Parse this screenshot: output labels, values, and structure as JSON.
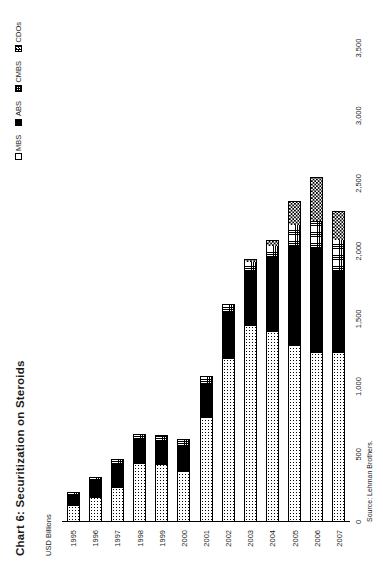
{
  "chart_data": {
    "type": "bar",
    "orientation": "horizontal-stacked",
    "title": "Chart 6: Securitization on Steroids",
    "ylabel": "USD Billions",
    "xlabel": "",
    "source": "Source: Lehman Brothers.",
    "grid": false,
    "legend_position": "top-right",
    "value_axis_range": [
      0,
      3500
    ],
    "value_axis_ticks": [
      "0",
      "500",
      "1,000",
      "1,500",
      "2,000",
      "2,500",
      "3,000",
      "3,500"
    ],
    "value_axis_tick_values": [
      0,
      500,
      1000,
      1500,
      2000,
      2500,
      3000,
      3500
    ],
    "categories": [
      "1995",
      "1996",
      "1997",
      "1998",
      "1999",
      "2000",
      "2001",
      "2002",
      "2003",
      "2004",
      "2005",
      "2006",
      "2007"
    ],
    "series": [
      {
        "name": "MBS",
        "pattern": "light-dotted",
        "values": [
          120,
          180,
          250,
          430,
          420,
          370,
          770,
          1200,
          1450,
          1400,
          1300,
          1250,
          1250
        ]
      },
      {
        "name": "ABS",
        "pattern": "solid-black",
        "values": [
          80,
          130,
          180,
          180,
          180,
          190,
          250,
          350,
          400,
          560,
          740,
          770,
          600
        ]
      },
      {
        "name": "CMBS",
        "pattern": "cross-hatch-grid",
        "values": [
          18,
          22,
          35,
          40,
          45,
          50,
          55,
          60,
          70,
          80,
          150,
          200,
          230
        ]
      },
      {
        "name": "CDOs",
        "pattern": "checkerboard",
        "values": [
          0,
          0,
          0,
          0,
          0,
          0,
          0,
          0,
          25,
          45,
          180,
          330,
          220
        ]
      }
    ],
    "totals": [
      218,
      332,
      465,
      650,
      645,
      610,
      1075,
      1610,
      1945,
      2085,
      2370,
      2550,
      2300
    ]
  },
  "legend": {
    "items": [
      {
        "label": "MBS",
        "swatch": "mbs-swatch"
      },
      {
        "label": "ABS",
        "swatch": "abs-swatch"
      },
      {
        "label": "CMBS",
        "swatch": "cmbs-swatch"
      },
      {
        "label": "CDOs",
        "swatch": "cdos-swatch"
      }
    ]
  }
}
